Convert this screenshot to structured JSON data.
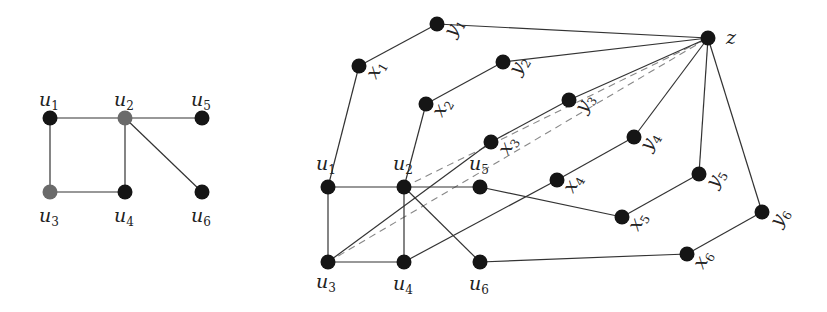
{
  "colors": {
    "node": "#151515",
    "node_gray": "#6a6a6a",
    "edge": "#333333",
    "dashed": "#888888"
  },
  "graphs": [
    {
      "name": "left-graph",
      "nodes": [
        {
          "id": "u1",
          "label": "u",
          "sub": "1",
          "x": 50,
          "y": 118,
          "color": "node",
          "lx": 39,
          "ly": 106,
          "rot": 0
        },
        {
          "id": "u2",
          "label": "u",
          "sub": "2",
          "x": 125,
          "y": 118,
          "color": "node_gray",
          "lx": 114,
          "ly": 106,
          "rot": 0
        },
        {
          "id": "u5",
          "label": "u",
          "sub": "5",
          "x": 202,
          "y": 118,
          "color": "node",
          "lx": 191,
          "ly": 106,
          "rot": 0
        },
        {
          "id": "u3",
          "label": "u",
          "sub": "3",
          "x": 50,
          "y": 192,
          "color": "node_gray",
          "lx": 39,
          "ly": 222,
          "rot": 0
        },
        {
          "id": "u4",
          "label": "u",
          "sub": "4",
          "x": 125,
          "y": 192,
          "color": "node",
          "lx": 114,
          "ly": 222,
          "rot": 0
        },
        {
          "id": "u6",
          "label": "u",
          "sub": "6",
          "x": 202,
          "y": 192,
          "color": "node",
          "lx": 191,
          "ly": 222,
          "rot": 0
        }
      ],
      "edges": [
        [
          "u1",
          "u2"
        ],
        [
          "u2",
          "u5"
        ],
        [
          "u1",
          "u3"
        ],
        [
          "u3",
          "u4"
        ],
        [
          "u2",
          "u4"
        ],
        [
          "u2",
          "u6"
        ]
      ],
      "dashed": []
    },
    {
      "name": "right-graph",
      "nodes": [
        {
          "id": "u1",
          "label": "u",
          "sub": "1",
          "x": 328,
          "y": 187,
          "color": "node",
          "lx": 316,
          "ly": 170,
          "rot": 0
        },
        {
          "id": "u2",
          "label": "u",
          "sub": "2",
          "x": 404,
          "y": 187,
          "color": "node",
          "lx": 393,
          "ly": 170,
          "rot": 0
        },
        {
          "id": "u5",
          "label": "u",
          "sub": "5",
          "x": 480,
          "y": 187,
          "color": "node",
          "lx": 469,
          "ly": 170,
          "rot": 0
        },
        {
          "id": "u3",
          "label": "u",
          "sub": "3",
          "x": 328,
          "y": 262,
          "color": "node",
          "lx": 316,
          "ly": 288,
          "rot": 0
        },
        {
          "id": "u4",
          "label": "u",
          "sub": "4",
          "x": 404,
          "y": 262,
          "color": "node",
          "lx": 393,
          "ly": 290,
          "rot": 0
        },
        {
          "id": "u6",
          "label": "u",
          "sub": "6",
          "x": 480,
          "y": 262,
          "color": "node",
          "lx": 469,
          "ly": 290,
          "rot": 0
        },
        {
          "id": "x1",
          "label": "x",
          "sub": "1",
          "x": 359,
          "y": 66,
          "color": "node",
          "lx": 376,
          "ly": 80,
          "rot": -60
        },
        {
          "id": "y1",
          "label": "y",
          "sub": "1",
          "x": 437,
          "y": 24,
          "color": "node",
          "lx": 454,
          "ly": 38,
          "rot": -60
        },
        {
          "id": "x2",
          "label": "x",
          "sub": "2",
          "x": 426,
          "y": 104,
          "color": "node",
          "lx": 442,
          "ly": 118,
          "rot": -60
        },
        {
          "id": "y2",
          "label": "y",
          "sub": "2",
          "x": 503,
          "y": 62,
          "color": "node",
          "lx": 519,
          "ly": 76,
          "rot": -60
        },
        {
          "id": "x3",
          "label": "x",
          "sub": "3",
          "x": 491,
          "y": 142,
          "color": "node",
          "lx": 508,
          "ly": 156,
          "rot": -60
        },
        {
          "id": "y3",
          "label": "y",
          "sub": "3",
          "x": 569,
          "y": 100,
          "color": "node",
          "lx": 585,
          "ly": 114,
          "rot": -60
        },
        {
          "id": "x4",
          "label": "x",
          "sub": "4",
          "x": 557,
          "y": 180,
          "color": "node",
          "lx": 573,
          "ly": 194,
          "rot": -60
        },
        {
          "id": "y4",
          "label": "y",
          "sub": "4",
          "x": 634,
          "y": 137,
          "color": "node",
          "lx": 650,
          "ly": 152,
          "rot": -60
        },
        {
          "id": "x5",
          "label": "x",
          "sub": "5",
          "x": 622,
          "y": 217,
          "color": "node",
          "lx": 638,
          "ly": 232,
          "rot": -60
        },
        {
          "id": "y5",
          "label": "y",
          "sub": "5",
          "x": 699,
          "y": 174,
          "color": "node",
          "lx": 716,
          "ly": 189,
          "rot": -60
        },
        {
          "id": "x6",
          "label": "x",
          "sub": "6",
          "x": 687,
          "y": 254,
          "color": "node",
          "lx": 703,
          "ly": 270,
          "rot": -60
        },
        {
          "id": "y6",
          "label": "y",
          "sub": "6",
          "x": 762,
          "y": 212,
          "color": "node",
          "lx": 780,
          "ly": 228,
          "rot": -60
        },
        {
          "id": "z",
          "label": "z",
          "sub": "",
          "x": 708,
          "y": 38,
          "color": "node",
          "lx": 726,
          "ly": 44,
          "rot": 0
        }
      ],
      "edges": [
        [
          "u1",
          "u2"
        ],
        [
          "u2",
          "u5"
        ],
        [
          "u1",
          "u3"
        ],
        [
          "u3",
          "u4"
        ],
        [
          "u2",
          "u4"
        ],
        [
          "u2",
          "u6"
        ],
        [
          "u1",
          "x1"
        ],
        [
          "x1",
          "y1"
        ],
        [
          "y1",
          "z"
        ],
        [
          "u2",
          "x2"
        ],
        [
          "x2",
          "y2"
        ],
        [
          "y2",
          "z"
        ],
        [
          "u3",
          "x3"
        ],
        [
          "x3",
          "y3"
        ],
        [
          "y3",
          "z"
        ],
        [
          "u4",
          "x4"
        ],
        [
          "x4",
          "y4"
        ],
        [
          "y4",
          "z"
        ],
        [
          "u5",
          "x5"
        ],
        [
          "x5",
          "y5"
        ],
        [
          "y5",
          "z"
        ],
        [
          "u6",
          "x6"
        ],
        [
          "x6",
          "y6"
        ],
        [
          "y6",
          "z"
        ]
      ],
      "dashed": [
        [
          "u2",
          "z"
        ],
        [
          "u3",
          "z"
        ]
      ]
    }
  ]
}
